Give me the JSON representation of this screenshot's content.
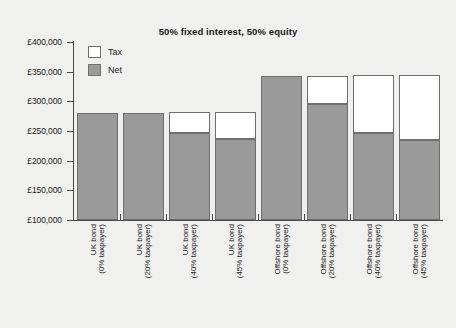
{
  "chart_data": {
    "type": "bar",
    "subtype": "stacked",
    "title": "50% fixed interest, 50% equity",
    "xlabel": "",
    "ylabel": "",
    "ylim": [
      100000,
      400000
    ],
    "ytick_labels": [
      "£400,000",
      "£350,000",
      "£300,000",
      "£250,000",
      "£200,000",
      "£150,000",
      "£100,000"
    ],
    "ytick_values": [
      400000,
      350000,
      300000,
      250000,
      200000,
      150000,
      100000
    ],
    "grid": false,
    "legend_position": "top-left-inside",
    "categories": [
      {
        "line1": "UK bond",
        "line2": "(0% taxpayer)"
      },
      {
        "line1": "UK bond",
        "line2": "(20% taxpayer)"
      },
      {
        "line1": "UK bond",
        "line2": "(40% taxpayer)"
      },
      {
        "line1": "UK bond",
        "line2": "(45% taxpayer)"
      },
      {
        "line1": "Offshore bond",
        "line2": "(0% taxpayer)"
      },
      {
        "line1": "Offshore bond",
        "line2": "(20% taxpayer)"
      },
      {
        "line1": "Offshore bond",
        "line2": "(40% taxpayer)"
      },
      {
        "line1": "Offshore bond",
        "line2": "(45% taxpayer)"
      }
    ],
    "series": [
      {
        "name": "Net",
        "color": "#9a9a9a",
        "values": [
          281000,
          281000,
          246000,
          236000,
          343000,
          295000,
          246000,
          234000
        ]
      },
      {
        "name": "Tax",
        "color": "#ffffff",
        "values": [
          0,
          0,
          35000,
          45000,
          0,
          48000,
          97000,
          109000
        ]
      }
    ],
    "totals": [
      281000,
      281000,
      281000,
      281000,
      343000,
      343000,
      343000,
      343000
    ]
  },
  "legend": {
    "items": [
      {
        "label": "Tax",
        "swatch": "white"
      },
      {
        "label": "Net",
        "swatch": "grey"
      }
    ]
  },
  "colors": {
    "background": "#f0f0ee",
    "net_fill": "#9a9a9a",
    "tax_fill": "#ffffff",
    "bar_stroke": "#6f6f6f",
    "axis": "#4a4a4a",
    "text": "#1a1a1a"
  }
}
